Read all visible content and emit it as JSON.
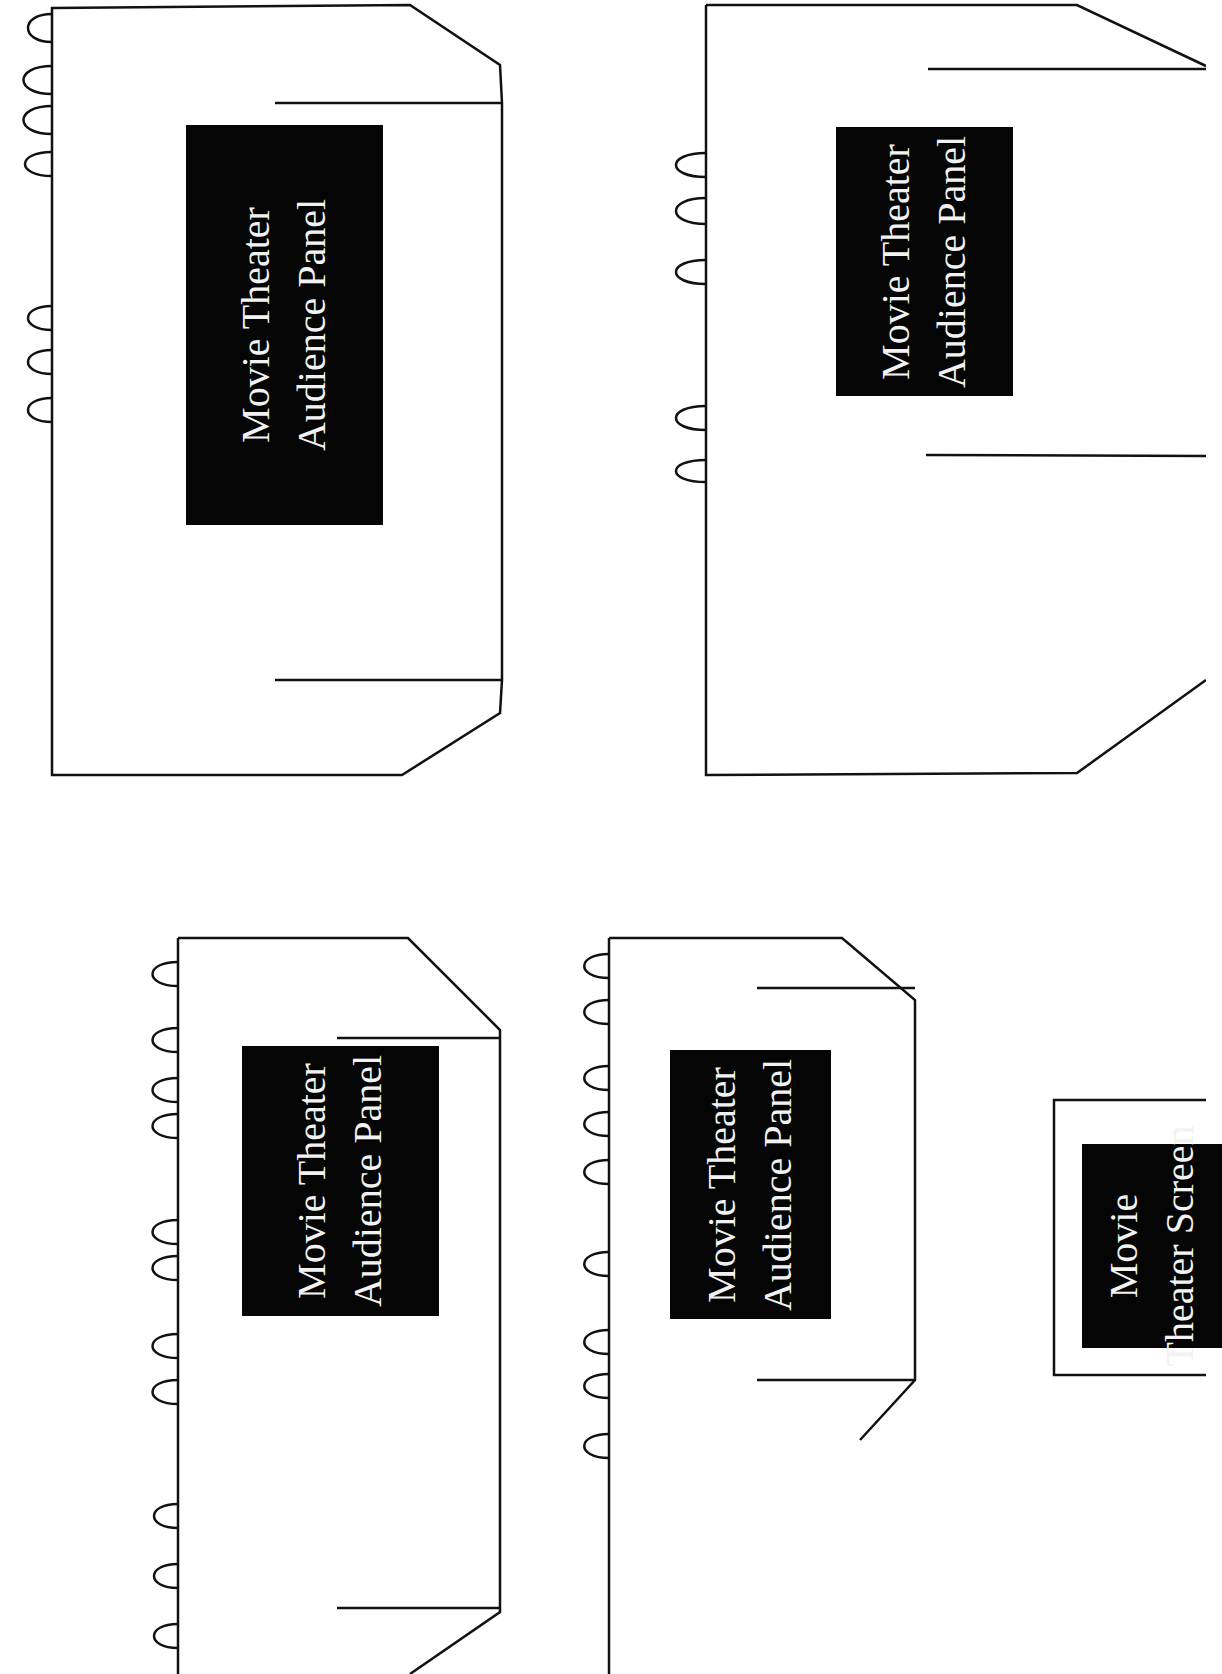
{
  "colors": {
    "stroke": "#111111",
    "label_bg": "#050505",
    "label_text": "#f2f2f2",
    "page_bg": "#ffffff"
  },
  "pieces": [
    {
      "type": "audience-panel",
      "line1": "Movie Theater",
      "line2": "Audience Panel"
    },
    {
      "type": "audience-panel",
      "line1": "Movie Theater",
      "line2": "Audience Panel"
    },
    {
      "type": "audience-panel",
      "line1": "Movie Theater",
      "line2": "Audience Panel"
    },
    {
      "type": "audience-panel",
      "line1": "Movie Theater",
      "line2": "Audience Panel"
    },
    {
      "type": "screen",
      "line1": "Movie",
      "line2": "Theater Screen"
    }
  ]
}
